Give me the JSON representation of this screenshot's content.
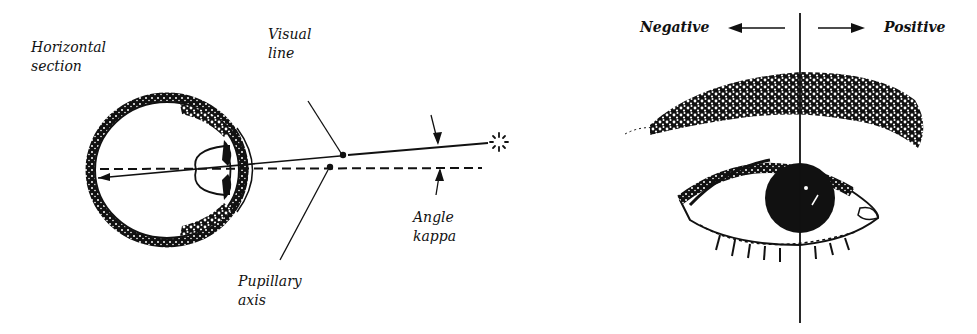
{
  "left_diagram": {
    "title_line1": "Horizontal",
    "title_line2": "section",
    "visual_line_1": "Visual",
    "visual_line_2": "line",
    "pupillary_1": "Pupillary",
    "pupillary_2": "axis",
    "angle_1": "Angle",
    "angle_2": "kappa",
    "target_icon": "star-fixation-icon"
  },
  "right_diagram": {
    "negative_label": "Negative",
    "positive_label": "Positive"
  },
  "colors": {
    "ink": "#111111",
    "background": "#ffffff"
  }
}
